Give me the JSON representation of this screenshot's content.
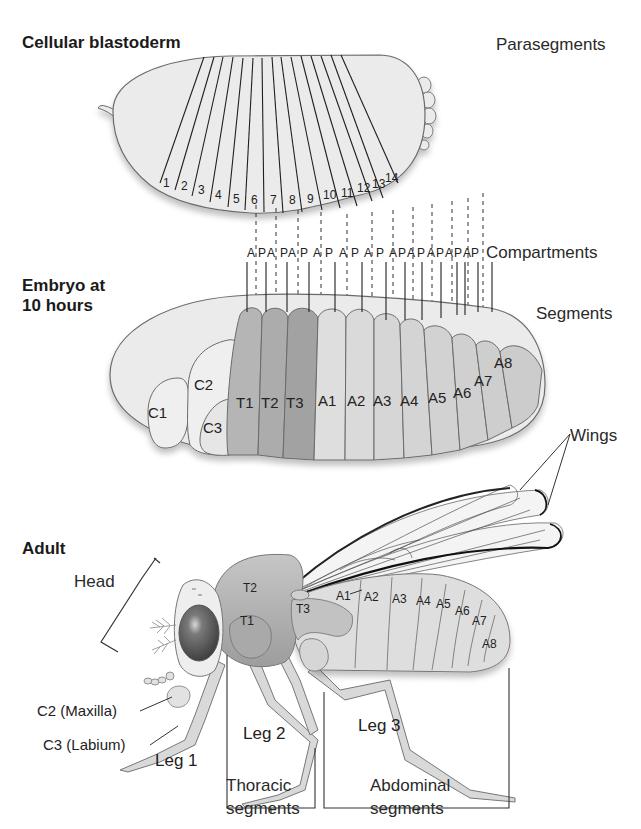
{
  "figure": {
    "sections": {
      "blastoderm_title": "Cellular blastoderm",
      "embryo_title_line1": "Embryo at",
      "embryo_title_line2": "10 hours",
      "adult_title": "Adult"
    },
    "side_labels": {
      "parasegments": "Parasegments",
      "compartments": "Compartments",
      "segments": "Segments",
      "wings": "Wings"
    },
    "parasegments": [
      "1",
      "2",
      "3",
      "4",
      "5",
      "6",
      "7",
      "8",
      "9",
      "10",
      "11",
      "12",
      "13",
      "14"
    ],
    "compartments": [
      "A",
      "P",
      "A",
      "P",
      "A",
      "P",
      "A",
      "P",
      "A",
      "P",
      "A",
      "P",
      "A",
      "P",
      "A",
      "P",
      "A",
      "P",
      "A",
      "P",
      "A",
      "P",
      "A",
      "P",
      "A",
      "P",
      "A",
      "P"
    ],
    "embryo_segments": {
      "head": [
        "C1",
        "C2",
        "C3"
      ],
      "thoracic": [
        "T1",
        "T2",
        "T3"
      ],
      "abdominal": [
        "A1",
        "A2",
        "A3",
        "A4",
        "A5",
        "A6",
        "A7",
        "A8"
      ]
    },
    "adult": {
      "thorax": [
        "T1",
        "T2",
        "T3"
      ],
      "abdomen": [
        "A1",
        "A2",
        "A3",
        "A4",
        "A5",
        "A6",
        "A7",
        "A8"
      ],
      "head_label": "Head",
      "maxilla_label": "C2 (Maxilla)",
      "labium_label": "C3 (Labium)",
      "legs": [
        "Leg 1",
        "Leg 2",
        "Leg 3"
      ],
      "thoracic_group_line1": "Thoracic",
      "thoracic_group_line2": "segments",
      "abdominal_group_line1": "Abdominal",
      "abdominal_group_line2": "segments"
    },
    "colors": {
      "outline": "#6b6b6b",
      "light_fill": "#ebebeb",
      "mid_fill": "#d6d6d6",
      "dark_fill": "#a9a9a9",
      "eye": "#5a5a5a",
      "text": "#222222"
    }
  }
}
